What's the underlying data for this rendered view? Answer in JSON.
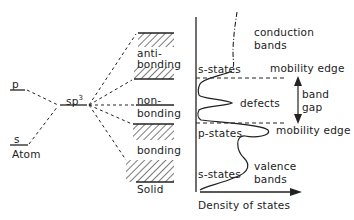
{
  "atom": {
    "title": "Atom",
    "levels": [
      {
        "label": "p"
      },
      {
        "label": "s"
      }
    ]
  },
  "hybrid": {
    "label": "sp",
    "superscript": "3"
  },
  "solid": {
    "title": "Solid",
    "bands": [
      {
        "label_line1": "anti-",
        "label_line2": "bonding"
      },
      {
        "label_line1": "non-",
        "label_line2": "bonding"
      },
      {
        "label_line1": "bonding",
        "label_line2": ""
      }
    ]
  },
  "dos": {
    "xlabel": "Density of states",
    "labels": {
      "conduction": [
        "conduction",
        "bands"
      ],
      "s_states_top": "s-states",
      "mobility_edge_top": "mobility edge",
      "defects": "defects",
      "band_gap": [
        "band",
        "gap"
      ],
      "p_states": "p-states",
      "mobility_edge_bottom": "mobility edge",
      "s_states_bottom": "s-states",
      "valence": [
        "valence",
        "bands"
      ]
    }
  },
  "colors": {
    "ink": "#222222",
    "background": "#ffffff"
  }
}
